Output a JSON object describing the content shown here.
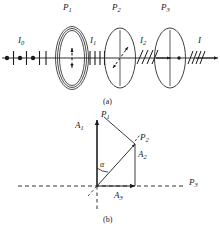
{
  "figure": {
    "panels": [
      {
        "id": "a",
        "caption": "(a)",
        "caption_x": 104,
        "caption_y": 99
      },
      {
        "id": "b",
        "caption": "(b)",
        "caption_x": 104,
        "caption_y": 218
      }
    ]
  },
  "panel_a": {
    "title_note": "Three polarizers P1, P2, P3 in series along an optical axis",
    "polarizers": [
      {
        "name": "P1",
        "label": "P",
        "sub": "1",
        "label_x": 64,
        "label_y": 8,
        "cx": 72,
        "cy": 58,
        "rx": 16,
        "ry": 31,
        "axis": "vertical-dashed-double-arrow"
      },
      {
        "name": "P2",
        "label": "P",
        "sub": "2",
        "label_x": 112,
        "label_y": 8,
        "cx": 120,
        "cy": 58,
        "rx": 15,
        "ry": 29,
        "axis": "diagonal-dashed-double-arrow"
      },
      {
        "name": "P3",
        "label": "P",
        "sub": "3",
        "label_x": 160,
        "label_y": 8,
        "cx": 170,
        "cy": 58,
        "rx": 15,
        "ry": 29,
        "axis": "horizontal-arrow-with-dot"
      }
    ],
    "beams": [
      {
        "name": "I0",
        "label": "I",
        "sub": "0",
        "label_x": 20,
        "label_y": 40,
        "kind": "unpolarized",
        "from_x": 2,
        "to_x": 54
      },
      {
        "name": "I1",
        "label": "I",
        "sub": "1",
        "label_x": 90,
        "label_y": 40,
        "kind": "vertical-polarized",
        "from_x": 88,
        "to_x": 106
      },
      {
        "name": "I2",
        "label": "I",
        "sub": "2",
        "label_x": 140,
        "label_y": 40,
        "kind": "slant-polarized",
        "from_x": 136,
        "to_x": 156
      },
      {
        "name": "I",
        "label": "I",
        "sub": "",
        "label_x": 198,
        "label_y": 40,
        "kind": "slant-polarized",
        "from_x": 186,
        "to_x": 218
      }
    ]
  },
  "panel_b": {
    "title_note": "Vector/amplitude diagram of transmission axes and amplitudes",
    "origin": {
      "x": 97,
      "y": 186
    },
    "axes": [
      {
        "name": "P1",
        "label": "P",
        "sub": "1",
        "label_x": 103,
        "label_y": 113,
        "type": "vertical-solid-with-dashed-continuation"
      },
      {
        "name": "P2",
        "label": "P",
        "sub": "2",
        "label_x": 141,
        "label_y": 134,
        "type": "tilted-line"
      },
      {
        "name": "P3",
        "label": "P",
        "sub": "3",
        "label_x": 190,
        "label_y": 179,
        "type": "horizontal-dashed"
      }
    ],
    "vectors": [
      {
        "name": "A1",
        "label": "A",
        "sub": "1",
        "label_x": 76,
        "label_y": 124,
        "tip_x": 97,
        "tip_y": 121
      },
      {
        "name": "A2",
        "label": "A",
        "sub": "2",
        "label_x": 139,
        "label_y": 153,
        "tip_x": 135,
        "tip_y": 144
      },
      {
        "name": "A3",
        "label": "A",
        "sub": "3",
        "label_x": 116,
        "label_y": 195,
        "tip_x": 135,
        "tip_y": 186
      }
    ],
    "angle": {
      "name": "alpha",
      "label": "α",
      "label_x": 101,
      "label_y": 164
    }
  },
  "colors": {
    "ink": "#1a1a1a",
    "stroke": "#2a2a2a",
    "background": "#ffffff"
  }
}
